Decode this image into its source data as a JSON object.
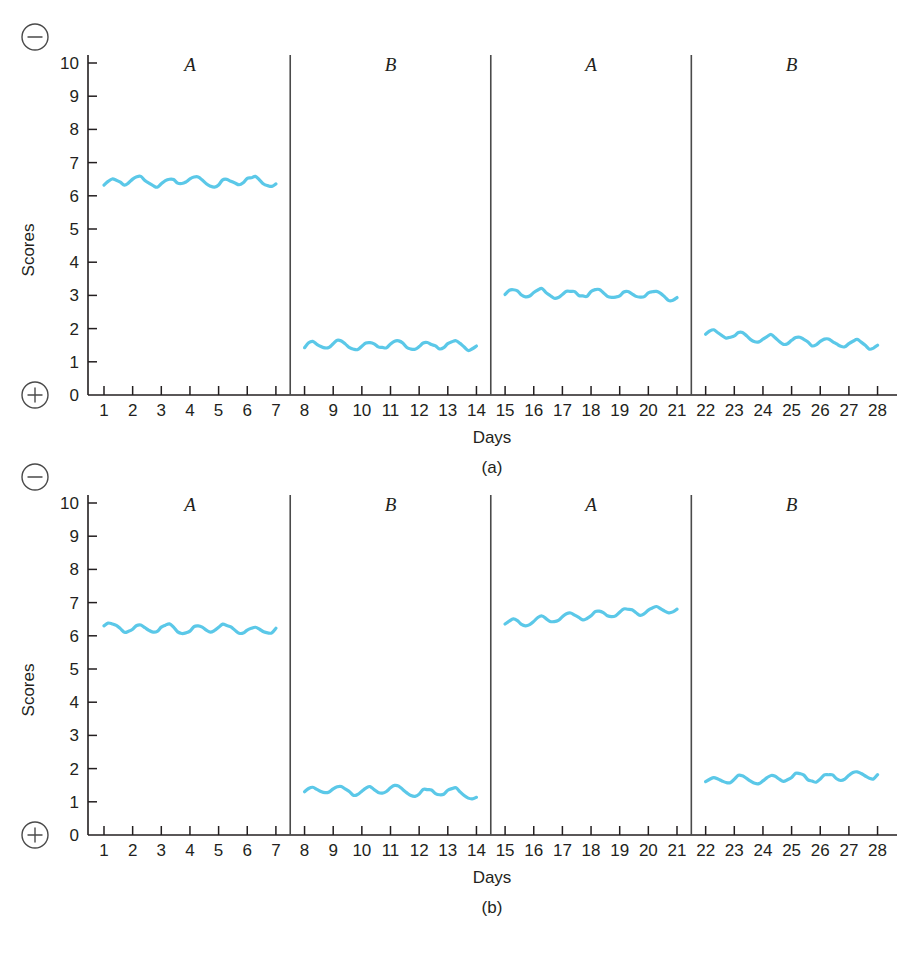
{
  "figure": {
    "caption": "",
    "panels": [
      {
        "id": "a",
        "caption": "(a)"
      },
      {
        "id": "b",
        "caption": "(b)"
      }
    ]
  },
  "axis": {
    "ylabel": "Scores",
    "xlabel": "Days",
    "y_ticks": [
      "0",
      "1",
      "2",
      "3",
      "4",
      "5",
      "6",
      "7",
      "8",
      "9",
      "10"
    ],
    "x_ticks": [
      "1",
      "2",
      "3",
      "4",
      "5",
      "6",
      "7",
      "8",
      "9",
      "10",
      "11",
      "12",
      "13",
      "14",
      "15",
      "16",
      "17",
      "18",
      "19",
      "20",
      "21",
      "22",
      "23",
      "24",
      "25",
      "26",
      "27",
      "28"
    ],
    "minus_symbol": "−",
    "plus_symbol": "+",
    "minus_icon_name": "minus-circle-icon",
    "plus_icon_name": "plus-circle-icon"
  },
  "style": {
    "line_color": "#5bc8e8",
    "line_width": 3.2,
    "axis_color": "#231f20",
    "separator_color": "#4a4a4a",
    "background": "#ffffff"
  },
  "chart_data": [
    {
      "type": "line",
      "id": "a",
      "title": "(a)",
      "xlabel": "Days",
      "ylabel": "Scores",
      "xlim": [
        0.4,
        28.6
      ],
      "ylim": [
        0,
        10
      ],
      "grid": false,
      "legend": null,
      "phase_labels": [
        "A",
        "B",
        "A",
        "B"
      ],
      "phase_ranges": [
        [
          1,
          7
        ],
        [
          8,
          14
        ],
        [
          15,
          21
        ],
        [
          22,
          28
        ]
      ],
      "phase_boundaries": [
        7.5,
        14.5,
        21.5
      ],
      "x": [
        1,
        2,
        3,
        4,
        5,
        6,
        7,
        8,
        9,
        10,
        11,
        12,
        13,
        14,
        15,
        16,
        17,
        18,
        19,
        20,
        21,
        22,
        23,
        24,
        25,
        26,
        27,
        28
      ],
      "values": [
        6.35,
        6.5,
        6.35,
        6.5,
        6.35,
        6.5,
        6.35,
        1.45,
        1.55,
        1.45,
        1.55,
        1.45,
        1.55,
        1.45,
        3.05,
        3.1,
        3.0,
        3.1,
        3.0,
        3.05,
        2.95,
        1.85,
        1.8,
        1.7,
        1.65,
        1.6,
        1.55,
        1.5
      ],
      "phase_means": [
        6.4,
        1.5,
        3.05,
        1.7
      ]
    },
    {
      "type": "line",
      "id": "b",
      "title": "(b)",
      "xlabel": "Days",
      "ylabel": "Scores",
      "xlim": [
        0.4,
        28.6
      ],
      "ylim": [
        0,
        10
      ],
      "grid": false,
      "legend": null,
      "phase_labels": [
        "A",
        "B",
        "A",
        "B"
      ],
      "phase_ranges": [
        [
          1,
          7
        ],
        [
          8,
          14
        ],
        [
          15,
          21
        ],
        [
          22,
          28
        ]
      ],
      "phase_boundaries": [
        7.5,
        14.5,
        21.5
      ],
      "x": [
        1,
        2,
        3,
        4,
        5,
        6,
        7,
        8,
        9,
        10,
        11,
        12,
        13,
        14,
        15,
        16,
        17,
        18,
        19,
        20,
        21,
        22,
        23,
        24,
        25,
        26,
        27,
        28
      ],
      "values": [
        6.3,
        6.2,
        6.25,
        6.15,
        6.25,
        6.15,
        6.2,
        1.3,
        1.4,
        1.3,
        1.4,
        1.25,
        1.35,
        1.15,
        6.35,
        6.45,
        6.55,
        6.6,
        6.7,
        6.75,
        6.8,
        1.6,
        1.7,
        1.65,
        1.75,
        1.7,
        1.8,
        1.8
      ],
      "phase_means": [
        6.2,
        1.3,
        6.55,
        1.7
      ]
    }
  ]
}
